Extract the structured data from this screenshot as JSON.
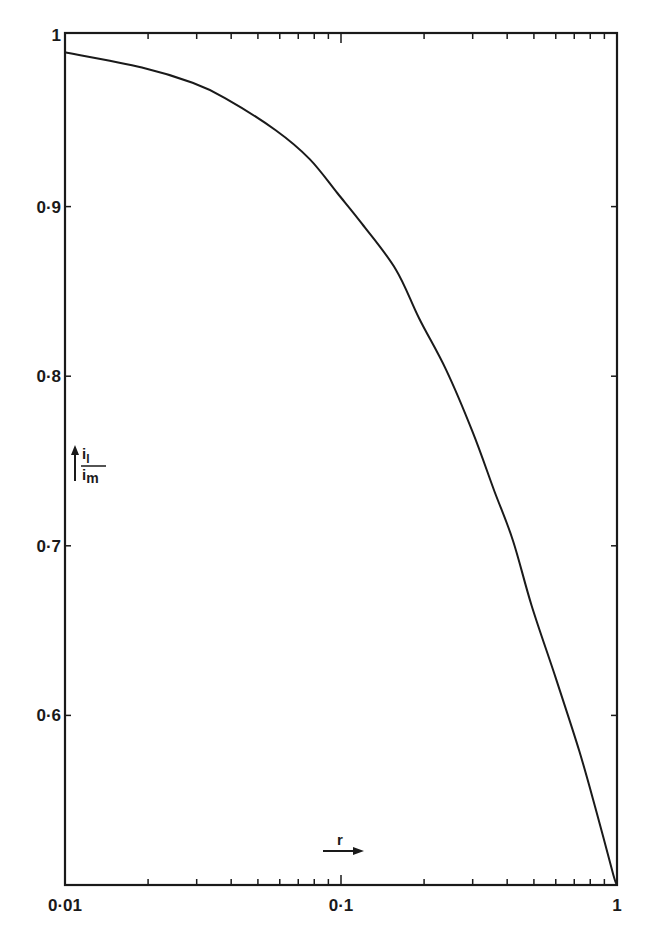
{
  "chart_data": {
    "type": "line",
    "title": "",
    "xlabel": "r",
    "ylabel": "i_l / i_m",
    "x_scale": "log",
    "xlim": [
      0.01,
      1
    ],
    "ylim": [
      0.5,
      1.0
    ],
    "grid": false,
    "legend": null,
    "x_ticks": [
      {
        "value": 0.01,
        "label": "0·01"
      },
      {
        "value": 0.1,
        "label": "0·1"
      },
      {
        "value": 1,
        "label": "1"
      }
    ],
    "y_ticks": [
      {
        "value": 1.0,
        "label": "1"
      },
      {
        "value": 0.9,
        "label": "0·9"
      },
      {
        "value": 0.8,
        "label": "0·8"
      },
      {
        "value": 0.7,
        "label": "0·7"
      },
      {
        "value": 0.6,
        "label": "0·6"
      }
    ],
    "series": [
      {
        "name": "i_l/i_m vs r",
        "x": [
          0.01,
          0.019,
          0.029,
          0.038,
          0.058,
          0.077,
          0.097,
          0.119,
          0.158,
          0.192,
          0.24,
          0.3,
          0.36,
          0.42,
          0.49,
          0.6,
          0.73,
          0.84,
          0.97,
          1.0
        ],
        "y": [
          0.991,
          0.982,
          0.973,
          0.964,
          0.945,
          0.928,
          0.908,
          0.89,
          0.863,
          0.834,
          0.804,
          0.767,
          0.732,
          0.703,
          0.665,
          0.622,
          0.579,
          0.544,
          0.506,
          0.5
        ]
      }
    ]
  },
  "labels": {
    "x_axis_symbol": "r",
    "y_axis_numerator": "i",
    "y_axis_numerator_sub": "l",
    "y_axis_denominator": "i",
    "y_axis_denominator_sub": "m"
  }
}
